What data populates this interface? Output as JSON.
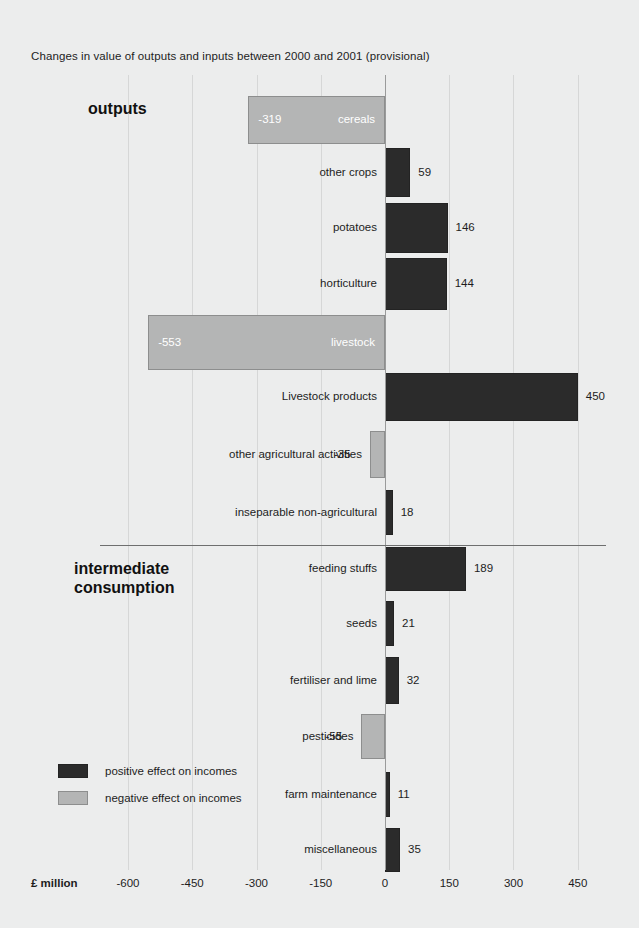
{
  "chart_data": {
    "type": "bar",
    "orientation": "horizontal",
    "title": "Changes in value of outputs and inputs between 2000 and 2001 (provisional)",
    "xlabel": "£ million",
    "ylabel": "",
    "xlim": [
      -675,
      495
    ],
    "xticks": [
      -600,
      -450,
      -300,
      -150,
      0,
      150,
      300,
      450
    ],
    "xtick_labels": [
      "-600",
      "-450",
      "-300",
      "-150",
      "0",
      "150",
      "300",
      "450"
    ],
    "grid": true,
    "legend_position": "lower-left",
    "sections": [
      {
        "name": "outputs",
        "label": "outputs",
        "categories": [
          "cereals",
          "other crops",
          "potatoes",
          "horticulture",
          "livestock",
          "Livestock products",
          "other agricultural activities",
          "inseparable non-agricultural"
        ],
        "values": [
          -319,
          59,
          146,
          144,
          -553,
          450,
          -35,
          18
        ]
      },
      {
        "name": "intermediate_consumption",
        "label": "intermediate\nconsumption",
        "categories": [
          "feeding stuffs",
          "seeds",
          "fertiliser and lime",
          "pesticides",
          "farm maintenance",
          "miscellaneous"
        ],
        "values": [
          189,
          21,
          32,
          -55,
          11,
          35
        ]
      }
    ],
    "legend": [
      {
        "label": "positive effect on incomes",
        "color": "#2b2b2b"
      },
      {
        "label": "negative effect on incomes",
        "color": "#b4b5b5"
      }
    ],
    "colors": {
      "positive": "#2b2b2b",
      "negative": "#b4b5b5",
      "background": "#eceded",
      "gridline": "#d6d7d7",
      "zero_line": "#9a9b9b",
      "text": "#1d1d1d"
    }
  },
  "section_labels": {
    "outputs": "outputs",
    "intermediate_line1": "intermediate",
    "intermediate_line2": "consumption"
  },
  "title": "Changes in value of outputs and inputs between 2000 and 2001 (provisional)",
  "axis": {
    "unit": "£ million",
    "ticks": [
      "-600",
      "-450",
      "-300",
      "-150",
      "0",
      "150",
      "300",
      "450"
    ]
  },
  "rows": [
    {
      "label": "cereals",
      "value": "-319",
      "label_inside": true,
      "value_inside": true
    },
    {
      "label": "other crops",
      "value": "59",
      "label_inside": false,
      "value_inside": false
    },
    {
      "label": "potatoes",
      "value": "146",
      "label_inside": false,
      "value_inside": false
    },
    {
      "label": "horticulture",
      "value": "144",
      "label_inside": false,
      "value_inside": false
    },
    {
      "label": "livestock",
      "value": "-553",
      "label_inside": true,
      "value_inside": true
    },
    {
      "label": "Livestock products",
      "value": "450",
      "label_inside": false,
      "value_inside": false
    },
    {
      "label": "other agricultural activities",
      "value": "-35",
      "label_inside": false,
      "value_inside": false
    },
    {
      "label": "inseparable non-agricultural",
      "value": "18",
      "label_inside": false,
      "value_inside": false
    },
    {
      "label": "feeding stuffs",
      "value": "189",
      "label_inside": false,
      "value_inside": false
    },
    {
      "label": "seeds",
      "value": "21",
      "label_inside": false,
      "value_inside": false
    },
    {
      "label": "fertiliser and lime",
      "value": "32",
      "label_inside": false,
      "value_inside": false
    },
    {
      "label": "pesticides",
      "value": "-55",
      "label_inside": false,
      "value_inside": false
    },
    {
      "label": "farm maintenance",
      "value": "11",
      "label_inside": false,
      "value_inside": false
    },
    {
      "label": "miscellaneous",
      "value": "35",
      "label_inside": false,
      "value_inside": false
    }
  ],
  "legend": {
    "positive": "positive effect on incomes",
    "negative": "negative effect on incomes"
  }
}
